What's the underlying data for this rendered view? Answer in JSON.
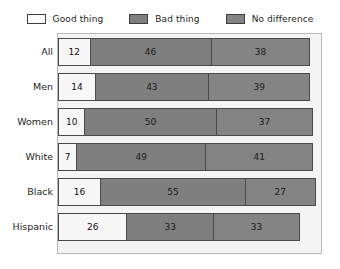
{
  "legend": {
    "position": "top",
    "items": [
      {
        "label": "Good thing",
        "swatch": "legend-swatch-good",
        "color": "#fbfbfb"
      },
      {
        "label": "Bad thing",
        "swatch": "legend-swatch-bad",
        "color": "#7f7f7f"
      },
      {
        "label": "No difference",
        "swatch": "legend-swatch-no-difference",
        "color": "#848484"
      }
    ]
  },
  "chart_data": {
    "type": "bar",
    "orientation": "horizontal",
    "stacked": true,
    "title": "",
    "subtitle": "",
    "xlabel": "",
    "ylabel": "",
    "xlim": [
      0,
      100
    ],
    "grid": false,
    "legend_position": "top",
    "categories": [
      "All",
      "Men",
      "Women",
      "White",
      "Black",
      "Hispanic"
    ],
    "series": [
      {
        "name": "Good thing",
        "values": [
          12,
          14,
          10,
          7,
          16,
          26
        ]
      },
      {
        "name": "Bad thing",
        "values": [
          46,
          43,
          50,
          49,
          55,
          33
        ]
      },
      {
        "name": "No difference",
        "values": [
          38,
          39,
          37,
          41,
          27,
          33
        ]
      }
    ],
    "rows": [
      {
        "category": "All",
        "good": 12,
        "bad": 46,
        "nodiff": 38,
        "total": 96
      },
      {
        "category": "Men",
        "good": 14,
        "bad": 43,
        "nodiff": 39,
        "total": 96
      },
      {
        "category": "Women",
        "good": 10,
        "bad": 50,
        "nodiff": 37,
        "total": 97
      },
      {
        "category": "White",
        "good": 7,
        "bad": 49,
        "nodiff": 41,
        "total": 97
      },
      {
        "category": "Black",
        "good": 16,
        "bad": 55,
        "nodiff": 27,
        "total": 98
      },
      {
        "category": "Hispanic",
        "good": 26,
        "bad": 33,
        "nodiff": 33,
        "total": 92
      }
    ]
  }
}
